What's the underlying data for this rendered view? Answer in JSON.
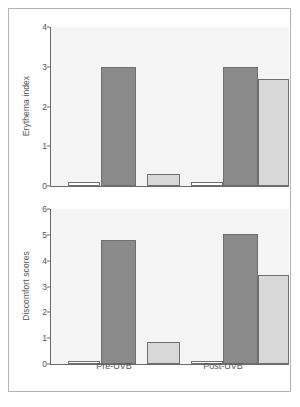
{
  "figure": {
    "background": "#ffffff",
    "frame_color": "#b4b4b4",
    "plot_background": "#f5f5f5",
    "axis_color": "#6a6a6a"
  },
  "xlabels": [
    {
      "label": "Pre-UVB",
      "center_pct": 27
    },
    {
      "label": "Post-UVB",
      "center_pct": 73
    }
  ],
  "chart_data": [
    {
      "type": "bar",
      "title": "",
      "xlabel": "",
      "ylabel": "Erythema index",
      "ylim": [
        0,
        4
      ],
      "yticks": [
        0,
        1,
        2,
        3,
        4
      ],
      "yticklabels": [
        "0",
        "1",
        "2",
        "3",
        "4"
      ],
      "grid": false,
      "legend": "none",
      "categories": [
        "Pre-UVB",
        "Post-UVB"
      ],
      "series": [
        {
          "name": "series-1",
          "color": "#ffffff",
          "values": [
            0.1,
            0.1
          ]
        },
        {
          "name": "series-2",
          "color": "#8a8a8a",
          "values": [
            3.0,
            3.0
          ]
        },
        {
          "name": "series-3",
          "color": "#d8d8d8",
          "values": [
            0.3,
            2.7
          ]
        }
      ],
      "bars": [
        {
          "group": "Pre-UVB",
          "series": "series-1",
          "value": 0.1,
          "color": "#ffffff",
          "left_pct": 7.5,
          "width_pct": 13.5
        },
        {
          "group": "Pre-UVB",
          "series": "series-2",
          "value": 3.0,
          "color": "#8a8a8a",
          "left_pct": 21.5,
          "width_pct": 14.5
        },
        {
          "group": "Pre-UVB",
          "series": "series-3",
          "value": 0.3,
          "color": "#d8d8d8",
          "left_pct": 40.5,
          "width_pct": 14.0
        },
        {
          "group": "Post-UVB",
          "series": "series-1",
          "value": 0.1,
          "color": "#ffffff",
          "left_pct": 59.0,
          "width_pct": 13.5
        },
        {
          "group": "Post-UVB",
          "series": "series-2",
          "value": 3.0,
          "color": "#8a8a8a",
          "left_pct": 72.5,
          "width_pct": 14.5
        },
        {
          "group": "Post-UVB",
          "series": "series-3",
          "value": 2.7,
          "color": "#d8d8d8",
          "left_pct": 87.0,
          "width_pct": 13.0
        }
      ]
    },
    {
      "type": "bar",
      "title": "",
      "xlabel": "",
      "ylabel": "Discomfort scores",
      "ylim": [
        0,
        6
      ],
      "yticks": [
        0,
        1,
        2,
        3,
        4,
        5,
        6
      ],
      "yticklabels": [
        "0",
        "1",
        "2",
        "3",
        "4",
        "5",
        "6"
      ],
      "grid": false,
      "legend": "none",
      "categories": [
        "Pre-UVB",
        "Post-UVB"
      ],
      "series": [
        {
          "name": "series-1",
          "color": "#ffffff",
          "values": [
            0.1,
            0.1
          ]
        },
        {
          "name": "series-2",
          "color": "#8a8a8a",
          "values": [
            4.8,
            5.05
          ]
        },
        {
          "name": "series-3",
          "color": "#d8d8d8",
          "values": [
            0.85,
            3.45
          ]
        }
      ],
      "bars": [
        {
          "group": "Pre-UVB",
          "series": "series-1",
          "value": 0.1,
          "color": "#ffffff",
          "left_pct": 7.5,
          "width_pct": 13.5
        },
        {
          "group": "Pre-UVB",
          "series": "series-2",
          "value": 4.8,
          "color": "#8a8a8a",
          "left_pct": 21.5,
          "width_pct": 14.5
        },
        {
          "group": "Pre-UVB",
          "series": "series-3",
          "value": 0.85,
          "color": "#d8d8d8",
          "left_pct": 40.5,
          "width_pct": 14.0
        },
        {
          "group": "Post-UVB",
          "series": "series-1",
          "value": 0.1,
          "color": "#ffffff",
          "left_pct": 59.0,
          "width_pct": 13.5
        },
        {
          "group": "Post-UVB",
          "series": "series-2",
          "value": 5.05,
          "color": "#8a8a8a",
          "left_pct": 72.5,
          "width_pct": 14.5
        },
        {
          "group": "Post-UVB",
          "series": "series-3",
          "value": 3.45,
          "color": "#d8d8d8",
          "left_pct": 87.0,
          "width_pct": 13.0
        }
      ]
    }
  ]
}
